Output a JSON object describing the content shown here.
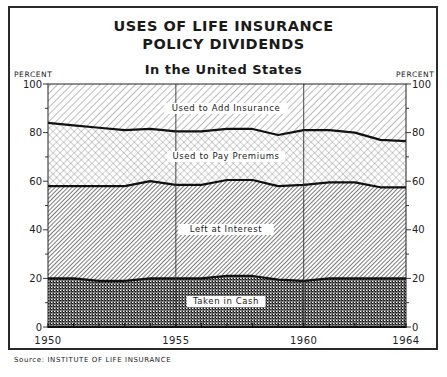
{
  "header": {
    "title_line1": "USES OF LIFE INSURANCE",
    "title_line2": "POLICY DIVIDENDS",
    "subtitle": "In the United States"
  },
  "axes": {
    "left_unit": "PERCENT",
    "right_unit": "PERCENT",
    "y_ticks": [
      "0",
      "20",
      "40",
      "60",
      "80",
      "100"
    ],
    "x_ticks": [
      "1950",
      "1955",
      "1960",
      "1964"
    ]
  },
  "source": "Source: INSTITUTE OF LIFE INSURANCE",
  "chart_data": {
    "type": "area",
    "stacked": true,
    "subtitle": "In the United States",
    "xlabel": "",
    "ylabel": "PERCENT",
    "ylim": [
      0,
      100
    ],
    "xlim": [
      1950,
      1964
    ],
    "grid": "vertical lines at 1955 and 1960",
    "legend": "labels placed inside regions",
    "x": [
      1950,
      1951,
      1952,
      1953,
      1954,
      1955,
      1956,
      1957,
      1958,
      1959,
      1960,
      1961,
      1962,
      1963,
      1964
    ],
    "series": [
      {
        "name": "Taken in Cash",
        "pattern": "dense checker",
        "values": [
          20,
          20,
          19,
          19,
          20,
          20,
          20,
          21,
          21,
          19.5,
          19,
          20,
          20,
          20,
          20
        ]
      },
      {
        "name": "Left at Interest",
        "pattern": "dense diagonal hatch",
        "values": [
          38,
          38,
          39,
          39,
          40,
          38.5,
          38.5,
          39.5,
          39.5,
          38.5,
          39.5,
          39.5,
          39.5,
          37.5,
          37.5
        ]
      },
      {
        "name": "Used to Pay Premiums",
        "pattern": "light crosshatch",
        "values": [
          26,
          25,
          24,
          23,
          21.5,
          22,
          22,
          21,
          21,
          21,
          22.5,
          21.5,
          20.5,
          19.5,
          19
        ]
      },
      {
        "name": "Used to Add Insurance",
        "pattern": "light diagonal hatch",
        "values": [
          16,
          17,
          18,
          19,
          18.5,
          19.5,
          19.5,
          18.5,
          18.5,
          21,
          19,
          19,
          20,
          23,
          23.5
        ]
      }
    ],
    "boundaries": {
      "cash_top": [
        20,
        20,
        19,
        19,
        20,
        20,
        20,
        21,
        21,
        19.5,
        19,
        20,
        20,
        20,
        20
      ],
      "interest_top": [
        58,
        58,
        58,
        58,
        60,
        58.5,
        58.5,
        60.5,
        60.5,
        58,
        58.5,
        59.5,
        59.5,
        57.5,
        57.5
      ],
      "premiums_top": [
        84,
        83,
        82,
        81,
        81.5,
        80.5,
        80.5,
        81.5,
        81.5,
        79,
        81,
        81,
        80,
        77,
        76.5
      ]
    },
    "region_labels": [
      "Used to Add Insurance",
      "Used to Pay Premiums",
      "Left at Interest",
      "Taken in Cash"
    ]
  },
  "colors": {
    "ink": "#1a1a1a",
    "paper": "#ffffff"
  }
}
